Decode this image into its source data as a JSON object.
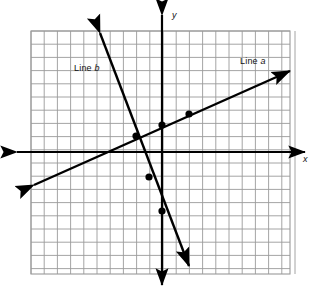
{
  "figure": {
    "kind": "coordinate-plane-graph",
    "background_color": "#ffffff",
    "width": 321,
    "height": 295
  },
  "grid": {
    "color": "#9a9a9a",
    "cell_size_px": 13.2,
    "left_px": 31,
    "top_px": 31,
    "right_px": 290,
    "bottom_px": 274,
    "columns": 19,
    "rows": 18,
    "visible": true
  },
  "axes": {
    "color": "#000000",
    "origin_px": {
      "x": 162,
      "y": 152
    },
    "x_axis": {
      "label": "x",
      "italic": true,
      "y_px": 152,
      "start_px": 17,
      "end_px": 305,
      "arrow_both_ends": true
    },
    "y_axis": {
      "label": "y",
      "italic": true,
      "x_px": 162,
      "start_px": 15,
      "end_px": 285,
      "arrow_both_ends": true
    },
    "tick_labels": [],
    "numbers_shown": false
  },
  "lines": [
    {
      "id": "line-a",
      "label_prefix": "Line",
      "label_name": "a",
      "label_full": "Line a",
      "color": "#000000",
      "stroke_width": 2.4,
      "arrow_both_ends": true,
      "slope": 0.5,
      "y_intercept": 2,
      "endpoints_px": {
        "x1": 34,
        "y1": 185,
        "x2": 290,
        "y2": 71
      },
      "points": [
        {
          "x": -2,
          "y": 1,
          "px": 136,
          "py": 136
        },
        {
          "x": 0,
          "y": 2,
          "px": 162,
          "py": 125
        },
        {
          "x": 2,
          "y": 3,
          "px": 189,
          "py": 114
        }
      ]
    },
    {
      "id": "line-b",
      "label_prefix": "Line",
      "label_name": "b",
      "label_full": "Line b",
      "color": "#000000",
      "stroke_width": 2.4,
      "arrow_both_ends": true,
      "slope": -2.6,
      "y_intercept": -4.5,
      "endpoints_px": {
        "x1": 100,
        "y1": 33,
        "x2": 189,
        "y2": 266
      },
      "points": [
        {
          "x": -1,
          "y": -2,
          "px": 149,
          "py": 177
        },
        {
          "x": 0,
          "y": -4.5,
          "px": 162,
          "py": 211
        }
      ]
    }
  ],
  "intersection": {
    "x": -2,
    "y": 1,
    "px": 136,
    "py": 136
  },
  "point_markers": {
    "color": "#000000",
    "radius_px": 3.6
  }
}
